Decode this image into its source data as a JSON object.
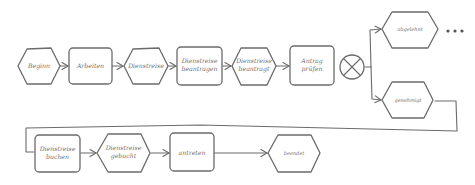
{
  "diagram": {
    "type": "EPC process chain (hand-drawn style)",
    "nodes": [
      {
        "id": "beginn",
        "kind": "event",
        "label": "Beginn"
      },
      {
        "id": "arbeiten",
        "kind": "function",
        "label": "Arbeiten"
      },
      {
        "id": "dienstreise",
        "kind": "event",
        "label": "Dienstreise"
      },
      {
        "id": "dr_beantragen",
        "kind": "function",
        "label_1": "Dienstreise",
        "label_2": "beantragen"
      },
      {
        "id": "dr_beantragt",
        "kind": "event",
        "label_1": "Dienstreise",
        "label_2": "beantragt"
      },
      {
        "id": "antrag_pruefen",
        "kind": "function",
        "label_1": "Antrag",
        "label_2": "prüfen"
      },
      {
        "id": "xor",
        "kind": "connector",
        "label": "XOR"
      },
      {
        "id": "abgelehnt",
        "kind": "event",
        "label": "abgelehnt"
      },
      {
        "id": "genehmigt",
        "kind": "event",
        "label": "genehmigt"
      },
      {
        "id": "dr_buchen",
        "kind": "function",
        "label_1": "Dienstreise",
        "label_2": "buchen"
      },
      {
        "id": "dr_gebucht",
        "kind": "event",
        "label_1": "Dienstreise",
        "label_2": "gebucht"
      },
      {
        "id": "antreten",
        "kind": "function",
        "label": "antreten"
      },
      {
        "id": "beendet",
        "kind": "event",
        "label": "beendet"
      }
    ],
    "continuation": "..."
  }
}
